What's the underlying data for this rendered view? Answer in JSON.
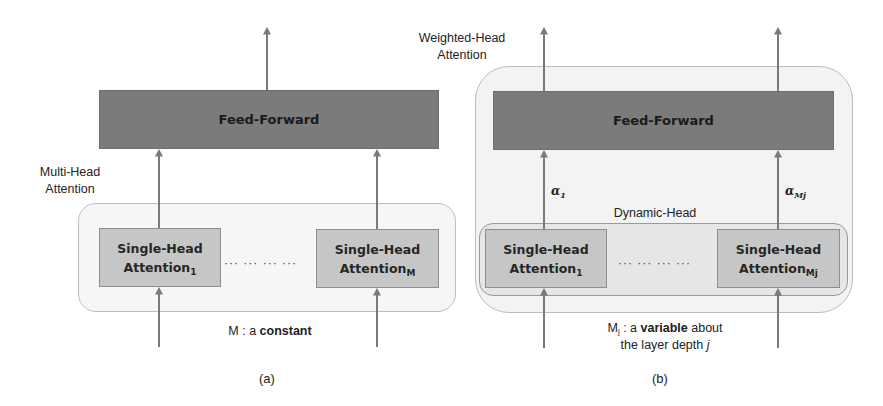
{
  "panel_a": {
    "caption": "(a)",
    "group_label_line1": "Multi-Head",
    "group_label_line2": "Attention",
    "feed_forward": "Feed-Forward",
    "head_first": {
      "line1": "Single-Head",
      "line2": "Attention",
      "subscript": "1"
    },
    "head_last": {
      "line1": "Single-Head",
      "line2": "Attention",
      "subscript": "M"
    },
    "ellipsis": "··· ··· ··· ···",
    "note_prefix": "M : a ",
    "note_bold": "constant"
  },
  "panel_b": {
    "caption": "(b)",
    "group_label_line1": "Weighted-Head",
    "group_label_line2": "Attention",
    "feed_forward": "Feed-Forward",
    "dynamic_label": "Dynamic-Head",
    "alpha_first": {
      "symbol": "α",
      "subscript": "1"
    },
    "alpha_last": {
      "symbol": "α",
      "subscript": "Mj"
    },
    "head_first": {
      "line1": "Single-Head",
      "line2": "Attention",
      "subscript": "1"
    },
    "head_last": {
      "line1": "Single-Head",
      "line2": "Attention",
      "subscript": "Mj"
    },
    "ellipsis": "··· ··· ··· ···",
    "note_var": "M",
    "note_var_sub": "j",
    "note_mid": " : a ",
    "note_bold": "variable",
    "note_suffix": " about",
    "note_line2": "the layer depth ",
    "note_line2_italic": "j"
  },
  "colors": {
    "feed_forward_fill": "#7b7b7b",
    "head_fill": "#c6c6c6",
    "container_fill": "#f6f6f6",
    "arrow": "#7a7a7a"
  }
}
